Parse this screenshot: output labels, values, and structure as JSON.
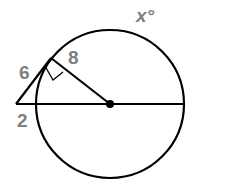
{
  "diagram": {
    "type": "geometry-circle-secant-tangent",
    "labels": {
      "arc": "x°",
      "segment_outer_tangent": "6",
      "segment_inner": "8",
      "segment_external": "2"
    },
    "colors": {
      "stroke": "#000000",
      "label": "#7f7f7f",
      "background": "#ffffff"
    },
    "elements": {
      "circle": {
        "cx": 110,
        "cy": 104,
        "r": 74
      },
      "center_point": {
        "cx": 110,
        "cy": 104,
        "r": 4
      },
      "diameter_line": {
        "x1": 16,
        "y1": 104,
        "x2": 184,
        "y2": 104
      },
      "tangent_line": {
        "x1": 16,
        "y1": 104,
        "x2": 51,
        "y2": 58
      },
      "radius_segment": {
        "x1": 51,
        "y1": 58,
        "x2": 110,
        "y2": 104
      },
      "right_angle_marker": true
    }
  }
}
